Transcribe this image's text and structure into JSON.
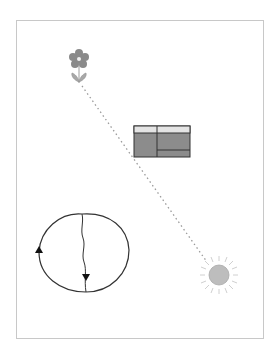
{
  "diagram": {
    "frame": {
      "x": 16,
      "y": 20,
      "width": 247,
      "height": 318,
      "stroke": "#c8c8c8"
    },
    "connector": {
      "style": "dotted",
      "from": [
        82,
        86
      ],
      "to": [
        207,
        262
      ],
      "color": "#9a9a9a"
    },
    "flower": {
      "cx": 79,
      "cy": 59,
      "petal_color": "#8a8a8a",
      "center_color": "#f0f0f0",
      "leaf_color": "#9e9e9e"
    },
    "table_box": {
      "x": 134,
      "y": 126,
      "width": 56,
      "height": 31,
      "header_color": "#e4e4e4",
      "body_color": "#8c8c8c",
      "border_color": "#333333"
    },
    "cycle_circle": {
      "cx": 84,
      "cy": 253,
      "rx": 45,
      "ry": 40,
      "stroke": "#333333",
      "arrow_up_at": [
        39,
        252
      ],
      "arrow_down_at": [
        86,
        278
      ]
    },
    "sun": {
      "cx": 219,
      "cy": 275,
      "r": 10,
      "ray_length": 8,
      "core_color": "#bdbdbd",
      "ray_color": "#d0d0d0"
    }
  }
}
